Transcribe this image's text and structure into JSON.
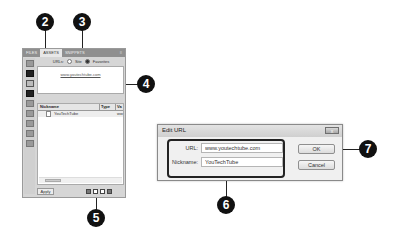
{
  "assets_panel": {
    "tabs": [
      {
        "label": "FILES",
        "active": false
      },
      {
        "label": "ASSETS",
        "active": true
      },
      {
        "label": "SNIPPETS",
        "active": false
      }
    ],
    "menu_icon": "panel-menu-icon",
    "sidebar_icons": [
      "images-icon",
      "colors-icon",
      "urls-icon",
      "flash-icon",
      "shockwave-icon",
      "movies-icon",
      "scripts-icon",
      "templates-icon",
      "library-icon"
    ],
    "view_options": {
      "label": "URLs:",
      "site_label": "Site",
      "favorites_label": "Favorites",
      "selected": "Favorites"
    },
    "preview_url": "www.youtechtube.com",
    "list": {
      "columns": [
        "Nickname",
        "Type",
        "Va"
      ],
      "rows": [
        {
          "nickname": "YouTechTube",
          "type": "",
          "value": "ww"
        }
      ]
    },
    "apply_label": "Apply",
    "bottom_icons": [
      "insert-icon",
      "new-favorite-icon",
      "edit-icon",
      "remove-icon"
    ]
  },
  "dialog": {
    "title": "Edit URL",
    "close_label": "x",
    "url_label": "URL:",
    "url_value": "www.youtechtube.com",
    "nickname_label": "Nickname:",
    "nickname_value": "YouTechTube",
    "ok_label": "OK",
    "cancel_label": "Cancel"
  },
  "callouts": {
    "c2": "2",
    "c3": "3",
    "c4": "4",
    "c5": "5",
    "c6": "6",
    "c7": "7"
  }
}
